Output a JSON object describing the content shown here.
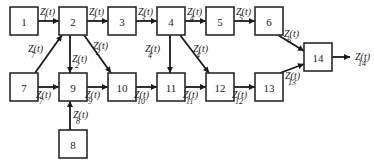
{
  "diagram": {
    "title": "",
    "nodes": [
      {
        "id": "1",
        "label": "1",
        "x": 10,
        "y": 7,
        "w": 28,
        "h": 28
      },
      {
        "id": "2",
        "label": "2",
        "x": 59,
        "y": 7,
        "w": 28,
        "h": 28
      },
      {
        "id": "3",
        "label": "3",
        "x": 108,
        "y": 7,
        "w": 28,
        "h": 28
      },
      {
        "id": "4",
        "label": "4",
        "x": 157,
        "y": 7,
        "w": 28,
        "h": 28
      },
      {
        "id": "5",
        "label": "5",
        "x": 206,
        "y": 7,
        "w": 28,
        "h": 28
      },
      {
        "id": "6",
        "label": "6",
        "x": 255,
        "y": 7,
        "w": 28,
        "h": 28
      },
      {
        "id": "7",
        "label": "7",
        "x": 10,
        "y": 73,
        "w": 28,
        "h": 28
      },
      {
        "id": "9",
        "label": "9",
        "x": 59,
        "y": 73,
        "w": 28,
        "h": 28
      },
      {
        "id": "10",
        "label": "10",
        "x": 108,
        "y": 73,
        "w": 28,
        "h": 28
      },
      {
        "id": "11",
        "label": "11",
        "x": 157,
        "y": 73,
        "w": 28,
        "h": 28
      },
      {
        "id": "12",
        "label": "12",
        "x": 206,
        "y": 73,
        "w": 28,
        "h": 28
      },
      {
        "id": "13",
        "label": "13",
        "x": 255,
        "y": 73,
        "w": 28,
        "h": 28
      },
      {
        "id": "14",
        "label": "14",
        "x": 304,
        "y": 43,
        "w": 28,
        "h": 28
      },
      {
        "id": "8",
        "label": "8",
        "x": 59,
        "y": 130,
        "w": 28,
        "h": 28
      }
    ],
    "edges": [
      {
        "from": "1",
        "to": "2",
        "x1": 38,
        "y1": 21,
        "x2": 59,
        "y2": 21,
        "label": "Z(t)",
        "sub": "1",
        "lx": 40,
        "ly": 15
      },
      {
        "from": "2",
        "to": "3",
        "x1": 87,
        "y1": 21,
        "x2": 108,
        "y2": 21,
        "label": "Z(t)",
        "sub": "2",
        "lx": 89,
        "ly": 15
      },
      {
        "from": "3",
        "to": "4",
        "x1": 136,
        "y1": 21,
        "x2": 157,
        "y2": 21,
        "label": "Z(t)",
        "sub": "3",
        "lx": 138,
        "ly": 15
      },
      {
        "from": "4",
        "to": "5",
        "x1": 185,
        "y1": 21,
        "x2": 206,
        "y2": 21,
        "label": "Z(t)",
        "sub": "4",
        "lx": 187,
        "ly": 15
      },
      {
        "from": "5",
        "to": "6",
        "x1": 234,
        "y1": 21,
        "x2": 255,
        "y2": 21,
        "label": "Z(t)",
        "sub": "5",
        "lx": 236,
        "ly": 15
      },
      {
        "from": "7",
        "to": "2",
        "x1": 35,
        "y1": 73,
        "x2": 62,
        "y2": 35,
        "label": "Z(t)",
        "sub": "7",
        "lx": 28,
        "ly": 52
      },
      {
        "from": "2",
        "to": "9",
        "x1": 70,
        "y1": 35,
        "x2": 70,
        "y2": 73,
        "label": "Z(t)",
        "sub": "2",
        "lx": 72,
        "ly": 62
      },
      {
        "from": "2",
        "to": "10",
        "x1": 84,
        "y1": 35,
        "x2": 111,
        "y2": 73,
        "label": "Z(t)",
        "sub": "2",
        "lx": 93,
        "ly": 49
      },
      {
        "from": "4",
        "to": "11",
        "x1": 170,
        "y1": 35,
        "x2": 170,
        "y2": 73,
        "label": "Z(t)",
        "sub": "4",
        "lx": 145,
        "ly": 52
      },
      {
        "from": "4",
        "to": "12",
        "x1": 180,
        "y1": 35,
        "x2": 209,
        "y2": 73,
        "label": "Z(t)",
        "sub": "4",
        "lx": 193,
        "ly": 52
      },
      {
        "from": "7",
        "to": "9",
        "x1": 38,
        "y1": 87,
        "x2": 59,
        "y2": 87,
        "label": "Z(t)",
        "sub": "7",
        "lx": 36,
        "ly": 98
      },
      {
        "from": "9",
        "to": "10",
        "x1": 87,
        "y1": 87,
        "x2": 108,
        "y2": 87,
        "label": "Z(t)",
        "sub": "9",
        "lx": 85,
        "ly": 98
      },
      {
        "from": "10",
        "to": "11",
        "x1": 136,
        "y1": 87,
        "x2": 157,
        "y2": 87,
        "label": "Z(t)",
        "sub": "10",
        "lx": 134,
        "ly": 98
      },
      {
        "from": "11",
        "to": "12",
        "x1": 185,
        "y1": 87,
        "x2": 206,
        "y2": 87,
        "label": "Z(t)",
        "sub": "11",
        "lx": 183,
        "ly": 98
      },
      {
        "from": "12",
        "to": "13",
        "x1": 234,
        "y1": 87,
        "x2": 255,
        "y2": 87,
        "label": "Z(t)",
        "sub": "12",
        "lx": 232,
        "ly": 98
      },
      {
        "from": "8",
        "to": "9",
        "x1": 70,
        "y1": 130,
        "x2": 70,
        "y2": 101,
        "label": "Z(t)",
        "sub": "8",
        "lx": 73,
        "ly": 118
      },
      {
        "from": "6",
        "to": "14",
        "x1": 278,
        "y1": 35,
        "x2": 304,
        "y2": 51,
        "label": "Z(t)",
        "sub": "6",
        "lx": 284,
        "ly": 37
      },
      {
        "from": "13",
        "to": "14",
        "x1": 280,
        "y1": 73,
        "x2": 304,
        "y2": 64,
        "label": "Z(t)",
        "sub": "13",
        "lx": 285,
        "ly": 79
      },
      {
        "from": "14",
        "to": "out",
        "x1": 332,
        "y1": 57,
        "x2": 350,
        "y2": 57,
        "label": "Z(t)",
        "sub": "14",
        "lx": 355,
        "ly": 60
      }
    ]
  }
}
